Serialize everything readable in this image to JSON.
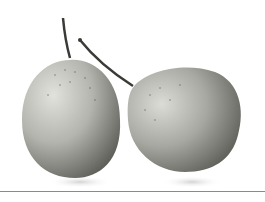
{
  "image": {
    "subject": "two pears",
    "style": "grayscale photograph on white background",
    "colors": {
      "background": "#ffffff",
      "pear_light": "#d6d6d0",
      "pear_dark": "#6e6e68",
      "stem": "#3a3a36",
      "divider": "#8a8a8a"
    }
  }
}
